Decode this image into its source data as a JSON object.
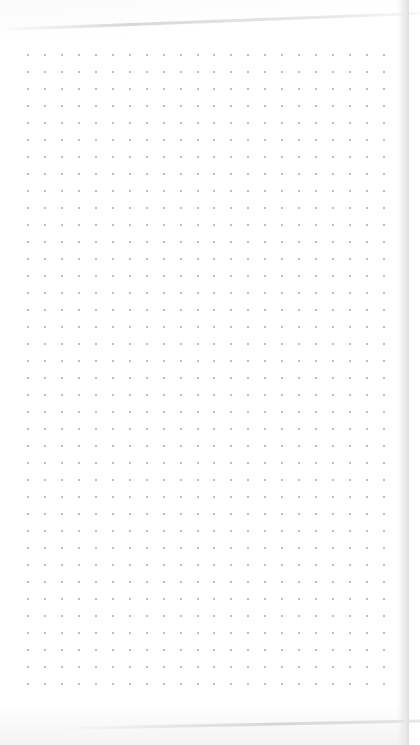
{
  "scene": {
    "description": "Photo of a blank dot-grid notebook page",
    "paper_color": "#ffffff",
    "dot_color": "#a8a8a8"
  },
  "dot_grid": {
    "origin_x": 28,
    "origin_y": 55,
    "spacing_x": 16.95,
    "spacing_y": 17.0,
    "columns": 22,
    "rows": 38
  }
}
